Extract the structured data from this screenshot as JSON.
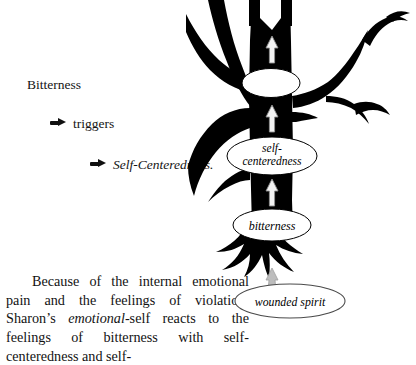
{
  "document": {
    "title": "Bitterness triggers Self-Centeredness diagram"
  },
  "outline": {
    "heading": "Bitterness",
    "items": [
      {
        "arrow_icon": "right-arrow-icon",
        "label": "triggers",
        "style": "roman"
      },
      {
        "arrow_icon": "right-arrow-icon",
        "label": "Self-Centeredness.",
        "style": "italic"
      }
    ]
  },
  "paragraph": {
    "lead": "Because of the internal emotional pain and the feelings of violation, Sharon’s ",
    "emphasis": "emotional",
    "tail": "-self reacts to the feelings of bitterness with self-centeredness and self-"
  },
  "diagram": {
    "type": "tree-silhouette",
    "colors": {
      "tree": "#000000",
      "background": "#ffffff",
      "ellipse_fill": "#ffffff",
      "ellipse_stroke": "#000000",
      "arrow_fill": "#f2f2f2",
      "arrow_stroke": "#9a9a9a",
      "root_arrow_fill": "#b8b8b8"
    },
    "nodes": [
      {
        "id": "crown-ellipse",
        "label": "",
        "shape": "ellipse",
        "filled": true
      },
      {
        "id": "self-centeredness-ellipse",
        "label": "self-\ncenteredness",
        "line1": "self-",
        "line2": "centeredness",
        "shape": "ellipse"
      },
      {
        "id": "bitterness-ellipse",
        "label": "bitterness",
        "shape": "ellipse"
      },
      {
        "id": "wounded-spirit-ellipse",
        "label": "wounded spirit",
        "shape": "ellipse-outline"
      }
    ],
    "arrows": [
      {
        "id": "arrow-upper-trunk",
        "direction": "up"
      },
      {
        "id": "arrow-mid-trunk",
        "direction": "up"
      },
      {
        "id": "arrow-lower-trunk",
        "direction": "up"
      },
      {
        "id": "arrow-root",
        "direction": "up"
      }
    ]
  }
}
